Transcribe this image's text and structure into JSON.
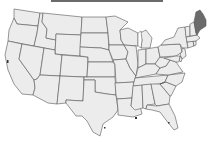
{
  "map": {
    "title": "",
    "region": "Contiguous United States",
    "highlighted_state": "Maine",
    "colors": {
      "default_fill": "#ececec",
      "highlight_fill": "#6b6b6b",
      "border": "#555555",
      "background": "#ffffff",
      "title_bar": "#6a6a6a"
    },
    "states": [
      {
        "name": "Washington",
        "highlighted": false
      },
      {
        "name": "Oregon",
        "highlighted": false
      },
      {
        "name": "California",
        "highlighted": false
      },
      {
        "name": "Idaho",
        "highlighted": false
      },
      {
        "name": "Nevada",
        "highlighted": false
      },
      {
        "name": "Montana",
        "highlighted": false
      },
      {
        "name": "Wyoming",
        "highlighted": false
      },
      {
        "name": "Utah",
        "highlighted": false
      },
      {
        "name": "Arizona",
        "highlighted": false
      },
      {
        "name": "Colorado",
        "highlighted": false
      },
      {
        "name": "New Mexico",
        "highlighted": false
      },
      {
        "name": "North Dakota",
        "highlighted": false
      },
      {
        "name": "South Dakota",
        "highlighted": false
      },
      {
        "name": "Nebraska",
        "highlighted": false
      },
      {
        "name": "Kansas",
        "highlighted": false
      },
      {
        "name": "Oklahoma",
        "highlighted": false
      },
      {
        "name": "Texas",
        "highlighted": false
      },
      {
        "name": "Minnesota",
        "highlighted": false
      },
      {
        "name": "Iowa",
        "highlighted": false
      },
      {
        "name": "Missouri",
        "highlighted": false
      },
      {
        "name": "Arkansas",
        "highlighted": false
      },
      {
        "name": "Louisiana",
        "highlighted": false
      },
      {
        "name": "Wisconsin",
        "highlighted": false
      },
      {
        "name": "Illinois",
        "highlighted": false
      },
      {
        "name": "Michigan",
        "highlighted": false
      },
      {
        "name": "Indiana",
        "highlighted": false
      },
      {
        "name": "Ohio",
        "highlighted": false
      },
      {
        "name": "Kentucky",
        "highlighted": false
      },
      {
        "name": "Tennessee",
        "highlighted": false
      },
      {
        "name": "Mississippi",
        "highlighted": false
      },
      {
        "name": "Alabama",
        "highlighted": false
      },
      {
        "name": "Georgia",
        "highlighted": false
      },
      {
        "name": "Florida",
        "highlighted": false
      },
      {
        "name": "South Carolina",
        "highlighted": false
      },
      {
        "name": "North Carolina",
        "highlighted": false
      },
      {
        "name": "Virginia",
        "highlighted": false
      },
      {
        "name": "West Virginia",
        "highlighted": false
      },
      {
        "name": "Pennsylvania",
        "highlighted": false
      },
      {
        "name": "New York",
        "highlighted": false
      },
      {
        "name": "New Jersey",
        "highlighted": false
      },
      {
        "name": "Delaware",
        "highlighted": false
      },
      {
        "name": "Maryland",
        "highlighted": false
      },
      {
        "name": "Connecticut",
        "highlighted": false
      },
      {
        "name": "Rhode Island",
        "highlighted": false
      },
      {
        "name": "Massachusetts",
        "highlighted": false
      },
      {
        "name": "Vermont",
        "highlighted": false
      },
      {
        "name": "New Hampshire",
        "highlighted": false
      },
      {
        "name": "Maine",
        "highlighted": true
      }
    ]
  }
}
